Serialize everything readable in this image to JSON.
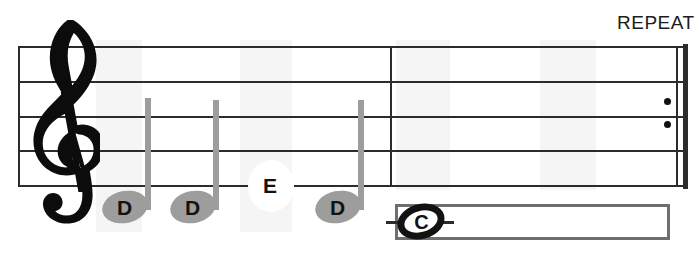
{
  "sheet": {
    "width": 698,
    "height": 258,
    "background": "#ffffff",
    "ink_color": "#2b2b2b",
    "note_gray": "#9d9d9d"
  },
  "clef": {
    "name": "treble-clef",
    "glyph": "𝄞",
    "label": "Treble clef"
  },
  "repeat": {
    "label": "REPEAT",
    "dots": 2
  },
  "staff": {
    "line_count": 5,
    "line_y": [
      46,
      81,
      116,
      150,
      185
    ],
    "left_x": 18,
    "right_x": 688
  },
  "measures": [
    {
      "name": "measure-1"
    },
    {
      "name": "measure-2"
    }
  ],
  "notes": [
    {
      "letter": "D",
      "style": "quarter",
      "x": 125,
      "y": 207,
      "stem": true
    },
    {
      "letter": "D",
      "style": "quarter",
      "x": 193,
      "y": 207,
      "stem": true
    },
    {
      "letter": "E",
      "style": "letter-only",
      "x": 270,
      "y": 185,
      "stem": false
    },
    {
      "letter": "D",
      "style": "quarter",
      "x": 338,
      "y": 207,
      "stem": true
    }
  ],
  "answer_box": {
    "name": "answer-box",
    "letter": "C",
    "note_style": "whole",
    "x": 395,
    "y": 202,
    "width": 275,
    "height": 38
  }
}
